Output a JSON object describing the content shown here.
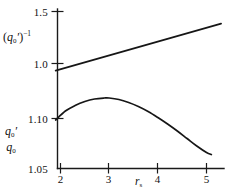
{
  "figure": {
    "background_color": "#ffffff",
    "ink_color": "#161616"
  },
  "labels": {
    "y_axis_upper": "(q₀′)⁻¹",
    "y_axis_upper_base": "q",
    "y_axis_upper_sub": "0",
    "y_axis_upper_prime": "′",
    "y_axis_upper_exp": "−1",
    "y_axis_lower_numerator": "q",
    "y_axis_lower_numerator_sub": "0",
    "y_axis_lower_numerator_prime": "′",
    "y_axis_lower_denominator": "q",
    "y_axis_lower_denominator_sub": "0",
    "x_axis_base": "r",
    "x_axis_sub": "s",
    "x_axis": "rₛ"
  },
  "chart_data": {
    "type": "line",
    "title": "",
    "subtitle": "",
    "xlabel": "r_s",
    "ylabel": "(q_0')^-1  and  q_0'/q_0",
    "grid": false,
    "legend": null,
    "xlim": [
      1.75,
      5.45
    ],
    "x_ticks": [
      2,
      3,
      4,
      5
    ],
    "x_tick_labels": [
      "2",
      "3",
      "4",
      "5"
    ],
    "y_ticks_upper": [
      1.0,
      1.5
    ],
    "y_ticks_upper_labels": [
      "1.0",
      "1.5"
    ],
    "y_ticks_lower": [
      1.05,
      1.1
    ],
    "y_ticks_lower_labels": [
      "1.05",
      "1.10"
    ],
    "ylim_upper": [
      0.87,
      1.55
    ],
    "ylim_lower": [
      1.045,
      1.128
    ],
    "series": [
      {
        "name": "(q_0')^-1",
        "scale": "upper",
        "shape": "straight-line",
        "x": [
          1.9,
          2.2,
          2.5,
          2.8,
          3.1,
          3.4,
          3.7,
          4.0,
          4.3,
          4.6,
          4.9,
          5.3
        ],
        "values": [
          0.932,
          0.971,
          1.011,
          1.051,
          1.091,
          1.131,
          1.171,
          1.211,
          1.251,
          1.291,
          1.331,
          1.384
        ]
      },
      {
        "name": "q_0'/q_0",
        "scale": "lower",
        "shape": "arch-peak-near-3",
        "x": [
          1.9,
          2.1,
          2.3,
          2.5,
          2.7,
          2.9,
          3.0,
          3.2,
          3.4,
          3.6,
          3.8,
          4.0,
          4.2,
          4.4,
          4.6,
          4.8,
          5.0,
          5.1
        ],
        "values": [
          1.0985,
          1.1075,
          1.113,
          1.117,
          1.1195,
          1.1205,
          1.1205,
          1.119,
          1.116,
          1.112,
          1.107,
          1.101,
          1.0945,
          1.0875,
          1.08,
          1.0725,
          1.066,
          1.064
        ]
      }
    ],
    "annotations": []
  }
}
